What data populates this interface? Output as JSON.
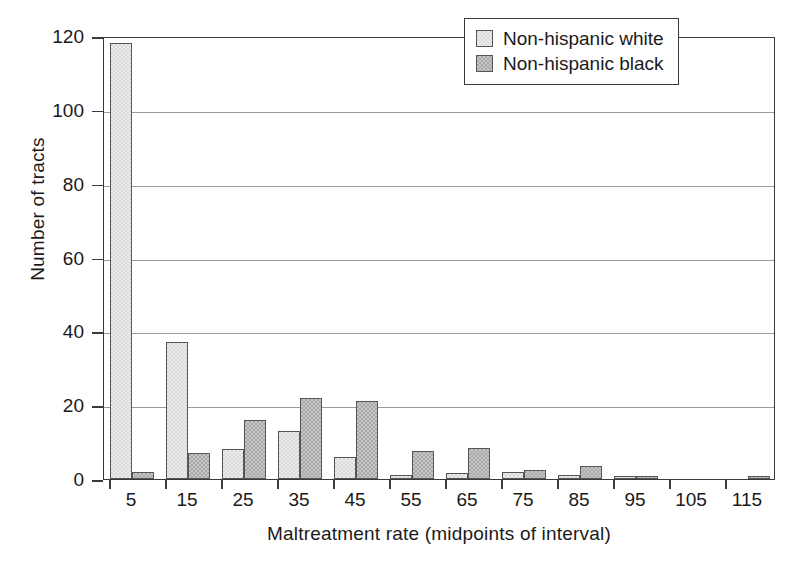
{
  "chart_data": {
    "type": "bar",
    "title": "",
    "subtitle": "",
    "xlabel": "Maltreatment rate (midpoints of interval)",
    "ylabel": "Number of tracts",
    "categories": [
      "5",
      "15",
      "25",
      "35",
      "45",
      "55",
      "65",
      "75",
      "85",
      "95",
      "105",
      "115"
    ],
    "series": [
      {
        "name": "Non-hispanic white",
        "color": "#d8d8d8",
        "values": [
          118,
          37,
          8,
          13,
          6,
          1,
          1.5,
          1.8,
          1,
          0.8,
          0,
          0
        ]
      },
      {
        "name": "Non-hispanic black",
        "color": "#a9a9a9",
        "values": [
          2,
          7,
          16,
          22,
          21,
          7.5,
          8.5,
          2.5,
          3.5,
          0.8,
          0,
          0.8
        ]
      }
    ],
    "ylim": [
      0,
      120
    ],
    "yticks": [
      0,
      20,
      40,
      60,
      80,
      100,
      120
    ],
    "ytick_labels": [
      "0",
      "20",
      "40",
      "60",
      "80",
      "100",
      "120"
    ],
    "xtick_labels": [
      "5",
      "15",
      "25",
      "35",
      "45",
      "55",
      "65",
      "75",
      "85",
      "95",
      "105",
      "115"
    ],
    "grid": "horizontal",
    "legend_position": "top-right",
    "axis_color": "#3a3a3a",
    "grid_color": "#9a9a9a",
    "background": "#ffffff"
  },
  "legend": {
    "entries": [
      {
        "label": "Non-hispanic white",
        "color": "#d8d8d8"
      },
      {
        "label": "Non-hispanic black",
        "color": "#a9a9a9"
      }
    ]
  }
}
